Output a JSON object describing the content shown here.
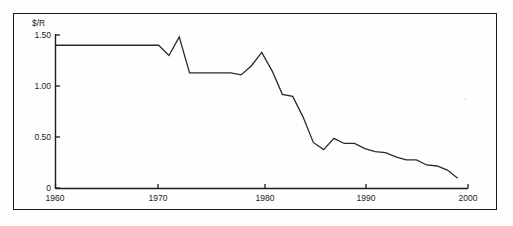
{
  "figure": {
    "unit_label": "$/R",
    "frame": {
      "border_color": "#1a1a1a",
      "background": "#fefefe"
    }
  },
  "chart_data": {
    "type": "line",
    "title": "",
    "subtitle": "",
    "xlabel": "",
    "ylabel": "$/R",
    "xlim": [
      1960,
      2000
    ],
    "ylim": [
      0,
      1.5
    ],
    "grid": false,
    "legend": null,
    "legend_position": "none",
    "line_color": "#2a2a2a",
    "xticks": [
      1960,
      1970,
      1980,
      1990,
      2000
    ],
    "xtick_labels": [
      "1960",
      "1970",
      "1980",
      "1990",
      "2000"
    ],
    "yticks": [
      0,
      0.5,
      1.0,
      1.5
    ],
    "ytick_labels": [
      "0",
      "0.50",
      "1.00",
      "1.50"
    ],
    "series": [
      {
        "name": "$/R exchange rate",
        "x": [
          1960,
          1961,
          1962,
          1963,
          1964,
          1965,
          1966,
          1967,
          1968,
          1969,
          1970,
          1971,
          1972,
          1973,
          1974,
          1975,
          1976,
          1977,
          1978,
          1979,
          1980,
          1981,
          1982,
          1983,
          1984,
          1985,
          1986,
          1987,
          1988,
          1989,
          1990,
          1991,
          1992,
          1993,
          1994,
          1995,
          1996,
          1997,
          1998,
          1999
        ],
        "y": [
          1.4,
          1.4,
          1.4,
          1.4,
          1.4,
          1.4,
          1.4,
          1.4,
          1.4,
          1.4,
          1.4,
          1.3,
          1.48,
          1.13,
          1.13,
          1.13,
          1.13,
          1.13,
          1.11,
          1.2,
          1.33,
          1.15,
          0.92,
          0.9,
          0.7,
          0.45,
          0.38,
          0.49,
          0.44,
          0.44,
          0.39,
          0.36,
          0.35,
          0.31,
          0.28,
          0.28,
          0.23,
          0.22,
          0.18,
          0.1
        ]
      }
    ]
  }
}
